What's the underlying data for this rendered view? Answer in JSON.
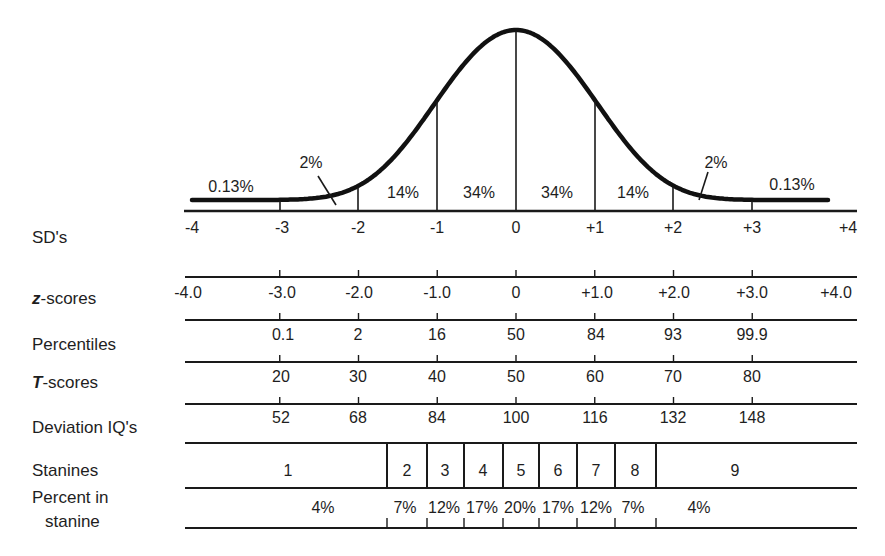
{
  "chart_data": {
    "type": "area",
    "title": "",
    "x": [
      -4,
      -3,
      -2,
      -1,
      0,
      1,
      2,
      3,
      4
    ],
    "xlabel": "SD's",
    "ylabel": "",
    "grid": false,
    "legend": "none",
    "curve_segments": [
      {
        "range": [
          -4,
          -3
        ],
        "label": "0.13%"
      },
      {
        "range": [
          -3,
          -2
        ],
        "label": "2%"
      },
      {
        "range": [
          -2,
          -1
        ],
        "label": "14%"
      },
      {
        "range": [
          -1,
          0
        ],
        "label": "34%"
      },
      {
        "range": [
          0,
          1
        ],
        "label": "34%"
      },
      {
        "range": [
          1,
          2
        ],
        "label": "14%"
      },
      {
        "range": [
          2,
          3
        ],
        "label": "2%"
      },
      {
        "range": [
          3,
          4
        ],
        "label": "0.13%"
      }
    ],
    "scales": {
      "sd": {
        "label": "SD's",
        "ticks": [
          "-4",
          "-3",
          "-2",
          "-1",
          "0",
          "+1",
          "+2",
          "+3",
          "+4"
        ]
      },
      "z_scores": {
        "label_prefix": "z",
        "label_suffix": "-scores",
        "ticks": [
          "-4.0",
          "-3.0",
          "-2.0",
          "-1.0",
          "0",
          "+1.0",
          "+2.0",
          "+3.0",
          "+4.0"
        ]
      },
      "percentiles": {
        "label": "Percentiles",
        "ticks": [
          "0.1",
          "2",
          "16",
          "50",
          "84",
          "93",
          "99.9"
        ]
      },
      "t_scores": {
        "label_prefix": "T",
        "label_suffix": "-scores",
        "ticks": [
          "20",
          "30",
          "40",
          "50",
          "60",
          "70",
          "80"
        ]
      },
      "deviation_iq": {
        "label": "Deviation IQ's",
        "ticks": [
          "52",
          "68",
          "84",
          "100",
          "116",
          "132",
          "148"
        ]
      },
      "stanines": {
        "label": "Stanines",
        "values": [
          "1",
          "2",
          "3",
          "4",
          "5",
          "6",
          "7",
          "8",
          "9"
        ]
      },
      "percent_in_stanine": {
        "label_line1": "Percent in",
        "label_line2": "stanine",
        "values": [
          "4%",
          "7%",
          "12%",
          "17%",
          "20%",
          "17%",
          "12%",
          "7%",
          "4%"
        ]
      }
    }
  }
}
